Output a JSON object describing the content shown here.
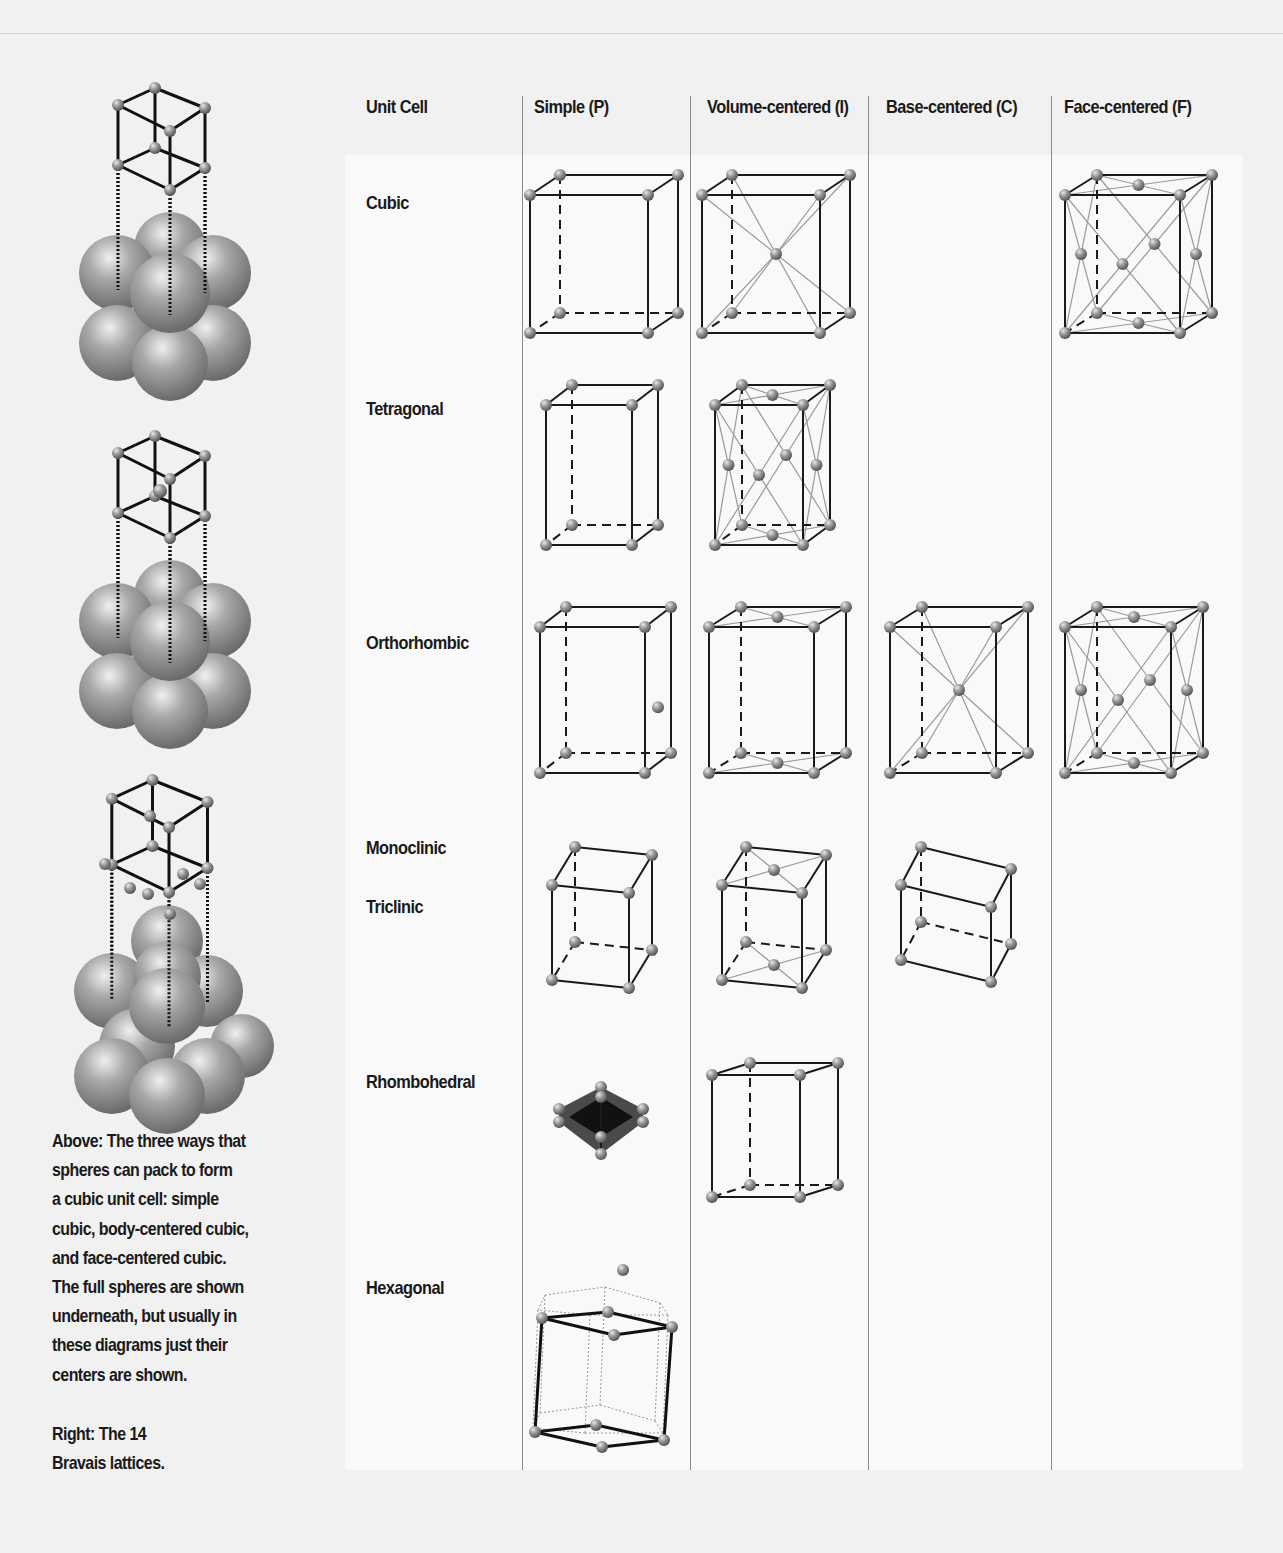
{
  "table": {
    "headers": [
      {
        "label": "Unit Cell",
        "x": 366
      },
      {
        "label": "Simple (P)",
        "x": 534
      },
      {
        "label": "Volume-centered (I)",
        "x": 707
      },
      {
        "label": "Base-centered (C)",
        "x": 886
      },
      {
        "label": "Face-centered (F)",
        "x": 1064
      }
    ],
    "rows": [
      {
        "label": "Cubic",
        "y": 192
      },
      {
        "label": "Tetragonal",
        "y": 398
      },
      {
        "label": "Orthorhombic",
        "y": 632
      },
      {
        "label": "Monoclinic",
        "y": 837
      },
      {
        "label": "Triclinic",
        "y": 896
      },
      {
        "label": "Rhombohedral",
        "y": 1071
      },
      {
        "label": "Hexagonal",
        "y": 1277
      }
    ],
    "divider_x": [
      522,
      690,
      868,
      1051
    ]
  },
  "caption": {
    "above": "Above: The three ways that spheres can pack to form a cubic unit cell: simple cubic, body-centered cubic, and face-centered cubic. The full spheres are shown underneath, but usually in these diagrams just their centers are shown.",
    "above_lines": [
      "Above: The three ways that",
      "spheres can pack to form",
      "a cubic unit cell: simple",
      "cubic, body-centered cubic,",
      "and face-centered cubic.",
      "The full spheres are shown",
      "underneath, but usually in",
      "these diagrams just their",
      "centers are shown."
    ],
    "right_lines": [
      "Right: The 14",
      "Bravais lattices."
    ]
  },
  "packings": [
    {
      "name": "simple-cubic",
      "top": 88,
      "type": "simple"
    },
    {
      "name": "body-centered-cubic",
      "top": 436,
      "type": "body"
    },
    {
      "name": "face-centered-cubic",
      "top": 776,
      "type": "face"
    }
  ],
  "lattices": [
    {
      "name": "cubic-simple",
      "x": 530,
      "y": 195,
      "w": 118,
      "h": 138,
      "dx": 30,
      "dy": -20,
      "centers": []
    },
    {
      "name": "cubic-body",
      "x": 702,
      "y": 195,
      "w": 118,
      "h": 138,
      "dx": 30,
      "dy": -20,
      "centers": [
        "body"
      ]
    },
    {
      "name": "cubic-face",
      "x": 1065,
      "y": 195,
      "w": 115,
      "h": 138,
      "dx": 32,
      "dy": -20,
      "centers": [
        "face"
      ]
    },
    {
      "name": "tetragonal-simple",
      "x": 546,
      "y": 405,
      "w": 86,
      "h": 140,
      "dx": 26,
      "dy": -20,
      "centers": []
    },
    {
      "name": "tetragonal-body",
      "x": 715,
      "y": 405,
      "w": 88,
      "h": 140,
      "dx": 27,
      "dy": -20,
      "centers": [
        "face"
      ]
    },
    {
      "name": "orthorhombic-simple",
      "x": 540,
      "y": 627,
      "w": 105,
      "h": 146,
      "dx": 26,
      "dy": -20,
      "centers": [
        "stray"
      ]
    },
    {
      "name": "orthorhombic-body",
      "x": 709,
      "y": 627,
      "w": 105,
      "h": 146,
      "dx": 32,
      "dy": -20,
      "centers": [
        "base"
      ]
    },
    {
      "name": "orthorhombic-base",
      "x": 890,
      "y": 627,
      "w": 106,
      "h": 146,
      "dx": 32,
      "dy": -20,
      "centers": [
        "body"
      ]
    },
    {
      "name": "orthorhombic-face",
      "x": 1065,
      "y": 627,
      "w": 106,
      "h": 146,
      "dx": 32,
      "dy": -20,
      "centers": [
        "face"
      ]
    },
    {
      "name": "monoclinic-simple",
      "x": 552,
      "y": 885,
      "w": 77,
      "h": 95,
      "dx": 23,
      "dy": -38,
      "skew": 8,
      "centers": []
    },
    {
      "name": "monoclinic-body",
      "x": 722,
      "y": 885,
      "w": 80,
      "h": 95,
      "dx": 24,
      "dy": -38,
      "skew": 8,
      "centers": [
        "base"
      ]
    },
    {
      "name": "triclinic-simple",
      "x": 901,
      "y": 885,
      "w": 90,
      "h": 75,
      "dx": 20,
      "dy": -38,
      "skew": 22,
      "centers": []
    }
  ],
  "rhombohedral": {
    "name": "rhombohedral-simple",
    "x": 601,
    "y": 1117
  },
  "rhombo_prism": {
    "name": "rhombohedral-volume",
    "x": 712,
    "y": 1075,
    "w": 88,
    "h": 122,
    "dx": 38,
    "dy": -12
  },
  "hexagonal": {
    "name": "hexagonal-simple",
    "x": 530,
    "y": 1255
  }
}
